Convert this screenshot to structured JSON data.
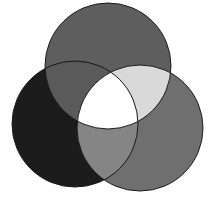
{
  "diagram": {
    "type": "venn",
    "sets": 3,
    "circles": [
      {
        "id": "top",
        "cx": 108,
        "cy": 66,
        "r": 63
      },
      {
        "id": "left",
        "cx": 75,
        "cy": 124,
        "r": 63
      },
      {
        "id": "right",
        "cx": 140,
        "cy": 128,
        "r": 63
      }
    ],
    "region_colors": {
      "top_only": "#5e5e5e",
      "left_only": "#1c1c1c",
      "right_only": "#6f6f6f",
      "top_left": "#5a5a5a",
      "top_right": "#d9d9d9",
      "left_right": "#858585",
      "all_three": "#ffffff"
    },
    "stroke_color": "#1a1a1a",
    "background": "#ffffff"
  }
}
